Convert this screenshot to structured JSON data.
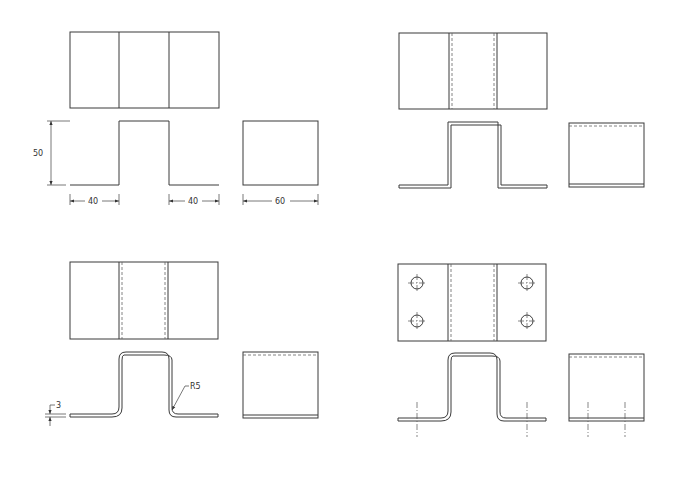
{
  "drawing": {
    "views": [
      {
        "id": "step-1",
        "description": "Basic outline: plan, front, side"
      },
      {
        "id": "step-2",
        "description": "Thickness added with hidden fold lines"
      },
      {
        "id": "step-3",
        "description": "Bend radii added"
      },
      {
        "id": "step-4",
        "description": "Holes and center lines added"
      }
    ],
    "dimensions": {
      "height": "50",
      "left_flange": "40",
      "right_flange": "40",
      "depth": "60",
      "thickness": "3",
      "bend_radius": "R5"
    }
  },
  "colors": {
    "line": "#3a3a3a",
    "hidden": "#666666",
    "background": "#ffffff"
  }
}
